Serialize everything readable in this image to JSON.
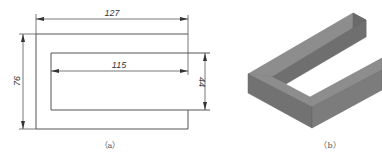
{
  "figure_a": {
    "caption": "（a）",
    "dimensions": {
      "outer_width": "127",
      "inner_width": "115",
      "outer_height": "76",
      "inner_height": "44"
    }
  },
  "figure_b": {
    "caption": "（b）",
    "colors": {
      "top_face": "#8a8a8a",
      "front_face": "#6e6e6e",
      "side_face": "#7c7c7c"
    }
  }
}
